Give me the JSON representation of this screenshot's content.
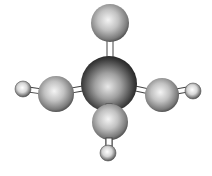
{
  "diagram": {
    "type": "ball-and-stick molecular model",
    "colors": {
      "background": "#ffffff",
      "atom_highlight": "#f2f2f2",
      "atom_mid": "#a8a8a8",
      "atom_dark": "#3a3a3a",
      "central_dark": "#1a1a1a",
      "bond_fill": "#ffffff",
      "bond_stroke": "#444444"
    },
    "atoms": [
      {
        "id": "central",
        "role": "central-atom",
        "cx": 109,
        "cy": 84,
        "r": 28
      },
      {
        "id": "top",
        "role": "medium-atom",
        "cx": 110,
        "cy": 23,
        "r": 19
      },
      {
        "id": "left",
        "role": "medium-atom",
        "cx": 56,
        "cy": 94,
        "r": 18
      },
      {
        "id": "right",
        "role": "medium-atom",
        "cx": 162,
        "cy": 95,
        "r": 17
      },
      {
        "id": "bottom",
        "role": "medium-atom",
        "cx": 110,
        "cy": 122,
        "r": 18
      },
      {
        "id": "left-small",
        "role": "small-atom",
        "cx": 23,
        "cy": 89,
        "r": 8
      },
      {
        "id": "right-small",
        "role": "small-atom",
        "cx": 193,
        "cy": 91,
        "r": 8
      },
      {
        "id": "bottom-small",
        "role": "small-atom",
        "cx": 108,
        "cy": 153,
        "r": 8
      }
    ]
  }
}
